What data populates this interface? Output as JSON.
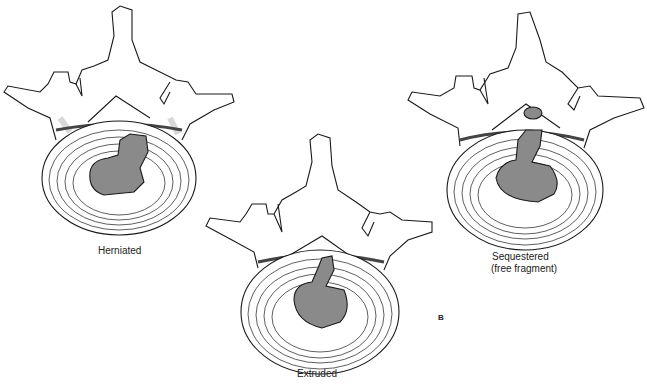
{
  "figure": {
    "panel_letter": "B",
    "colors": {
      "outline": "#1a1a1a",
      "nucleus": "#8a8a8a",
      "bone_shade": "#d8d8d8",
      "background": "#ffffff"
    },
    "vertebrae": [
      {
        "id": "herniated",
        "label": "Herniated"
      },
      {
        "id": "extruded",
        "label": "Extruded"
      },
      {
        "id": "sequestered",
        "label_line1": "Sequestered",
        "label_line2": "(free fragment)"
      }
    ]
  }
}
